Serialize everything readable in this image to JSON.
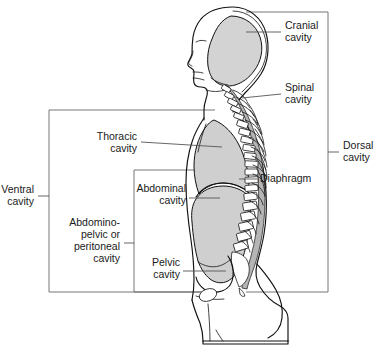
{
  "diagram": {
    "colors": {
      "cavity_gray": "#cfcfcf",
      "cranial_gray": "#d3d3d3",
      "canal_gray": "#b9b9b9",
      "outline_black": "#111111",
      "leader_gray": "#555555",
      "box_gray": "#666666",
      "background": "#ffffff"
    },
    "labels": {
      "cranial_cavity": {
        "line1": "Cranial",
        "line2": "cavity"
      },
      "spinal_cavity": {
        "line1": "Spinal",
        "line2": "cavity"
      },
      "dorsal_cavity": {
        "line1": "Dorsal",
        "line2": "cavity"
      },
      "ventral_cavity": {
        "line1": "Ventral",
        "line2": "cavity"
      },
      "thoracic_cavity": {
        "line1": "Thoracic",
        "line2": "cavity"
      },
      "abdominal_cavity": {
        "line1": "Abdominal",
        "line2": "cavity"
      },
      "pelvic_cavity": {
        "line1": "Pelvic",
        "line2": "cavity"
      },
      "abdominopelvic_cavity": {
        "line1": "Abdomino-",
        "line2": "pelvic or",
        "line3": "peritoneal",
        "line4": "cavity"
      },
      "diaphragm": {
        "line1": "Diaphragm"
      }
    }
  }
}
